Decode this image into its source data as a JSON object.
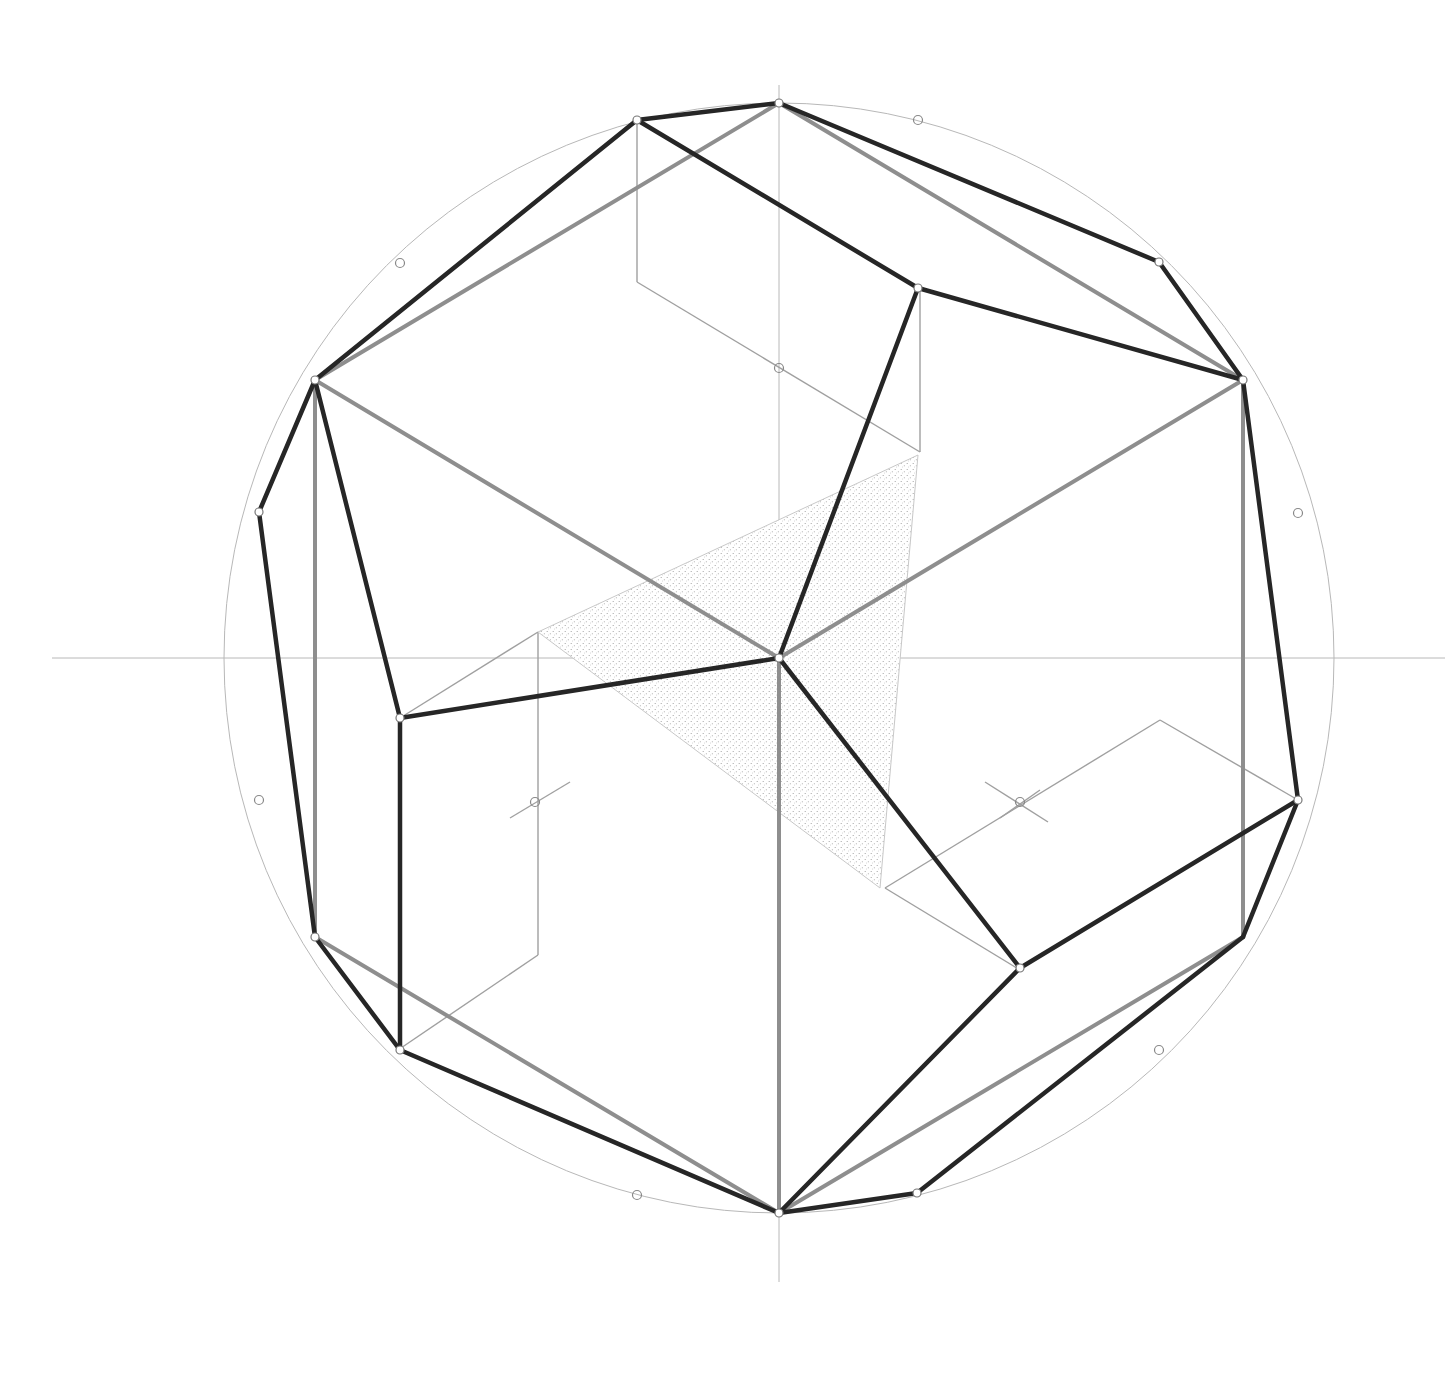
{
  "diagram": {
    "title": "",
    "width": 1448,
    "height": 1379,
    "colors": {
      "background": "#ffffff",
      "construction": "#b8b8b8",
      "hidden_edge": "#8e8e8e",
      "visible_edge": "#262626",
      "stipple": "#9a9a9a"
    },
    "circle": {
      "cx": 779,
      "cy": 658,
      "r": 555
    },
    "axes": [
      {
        "x1": 52,
        "y1": 658,
        "x2": 1445,
        "y2": 658
      },
      {
        "x1": 779,
        "y1": 85,
        "x2": 779,
        "y2": 1282
      }
    ],
    "shaded_triangle": [
      [
        538,
        632
      ],
      [
        918,
        455
      ],
      [
        880,
        888
      ]
    ],
    "construction_lines": [
      [
        [
          637,
          120
        ],
        [
          637,
          282
        ]
      ],
      [
        [
          637,
          282
        ],
        [
          920,
          452
        ]
      ],
      [
        [
          920,
          290
        ],
        [
          920,
          452
        ]
      ],
      [
        [
          538,
          632
        ],
        [
          400,
          718
        ]
      ],
      [
        [
          538,
          632
        ],
        [
          538,
          955
        ]
      ],
      [
        [
          538,
          955
        ],
        [
          398,
          1050
        ]
      ],
      [
        [
          885,
          888
        ],
        [
          1160,
          720
        ]
      ],
      [
        [
          1160,
          720
        ],
        [
          1298,
          800
        ]
      ],
      [
        [
          885,
          888
        ],
        [
          1020,
          970
        ]
      ],
      [
        [
          510,
          818
        ],
        [
          570,
          782
        ]
      ],
      [
        [
          985,
          782
        ],
        [
          1048,
          822
        ]
      ],
      [
        [
          1000,
          818
        ],
        [
          1040,
          790
        ]
      ]
    ],
    "hidden_edges": [
      [
        [
          779,
          103
        ],
        [
          315,
          380
        ]
      ],
      [
        [
          779,
          103
        ],
        [
          1243,
          380
        ]
      ],
      [
        [
          315,
          380
        ],
        [
          779,
          658
        ]
      ],
      [
        [
          1243,
          380
        ],
        [
          779,
          658
        ]
      ],
      [
        [
          779,
          658
        ],
        [
          779,
          1213
        ]
      ],
      [
        [
          315,
          380
        ],
        [
          315,
          937
        ]
      ],
      [
        [
          1243,
          380
        ],
        [
          1243,
          937
        ]
      ],
      [
        [
          315,
          937
        ],
        [
          779,
          1213
        ]
      ],
      [
        [
          1243,
          937
        ],
        [
          779,
          1213
        ]
      ]
    ],
    "visible_edges": [
      [
        [
          637,
          120
        ],
        [
          779,
          103
        ]
      ],
      [
        [
          637,
          120
        ],
        [
          918,
          288
        ]
      ],
      [
        [
          637,
          120
        ],
        [
          315,
          380
        ]
      ],
      [
        [
          918,
          288
        ],
        [
          1243,
          380
        ]
      ],
      [
        [
          918,
          288
        ],
        [
          779,
          658
        ]
      ],
      [
        [
          779,
          103
        ],
        [
          1159,
          262
        ]
      ],
      [
        [
          1159,
          262
        ],
        [
          1243,
          380
        ]
      ],
      [
        [
          315,
          380
        ],
        [
          400,
          718
        ]
      ],
      [
        [
          315,
          380
        ],
        [
          259,
          512
        ]
      ],
      [
        [
          259,
          512
        ],
        [
          315,
          937
        ]
      ],
      [
        [
          400,
          718
        ],
        [
          779,
          658
        ]
      ],
      [
        [
          400,
          718
        ],
        [
          400,
          1050
        ]
      ],
      [
        [
          779,
          658
        ],
        [
          1020,
          968
        ]
      ],
      [
        [
          1020,
          968
        ],
        [
          1298,
          800
        ]
      ],
      [
        [
          1020,
          968
        ],
        [
          779,
          1213
        ]
      ],
      [
        [
          1243,
          380
        ],
        [
          1298,
          800
        ]
      ],
      [
        [
          1298,
          800
        ],
        [
          1243,
          937
        ]
      ],
      [
        [
          315,
          937
        ],
        [
          400,
          1050
        ]
      ],
      [
        [
          400,
          1050
        ],
        [
          779,
          1213
        ]
      ],
      [
        [
          1243,
          937
        ],
        [
          917,
          1193
        ]
      ],
      [
        [
          917,
          1193
        ],
        [
          779,
          1213
        ]
      ]
    ],
    "vertex_markers": [
      [
        637,
        120
      ],
      [
        918,
        288
      ],
      [
        1243,
        380
      ],
      [
        1298,
        800
      ],
      [
        1020,
        968
      ],
      [
        779,
        1213
      ],
      [
        400,
        1050
      ],
      [
        315,
        937
      ],
      [
        259,
        512
      ],
      [
        315,
        380
      ],
      [
        400,
        718
      ],
      [
        779,
        658
      ],
      [
        779,
        103
      ],
      [
        1159,
        262
      ],
      [
        917,
        1193
      ]
    ],
    "circle_markers": [
      [
        918,
        120
      ],
      [
        400,
        263
      ],
      [
        1298,
        513
      ],
      [
        259,
        800
      ],
      [
        1159,
        1050
      ],
      [
        637,
        1195
      ],
      [
        779,
        368
      ],
      [
        535,
        802
      ],
      [
        1020,
        802
      ]
    ]
  }
}
